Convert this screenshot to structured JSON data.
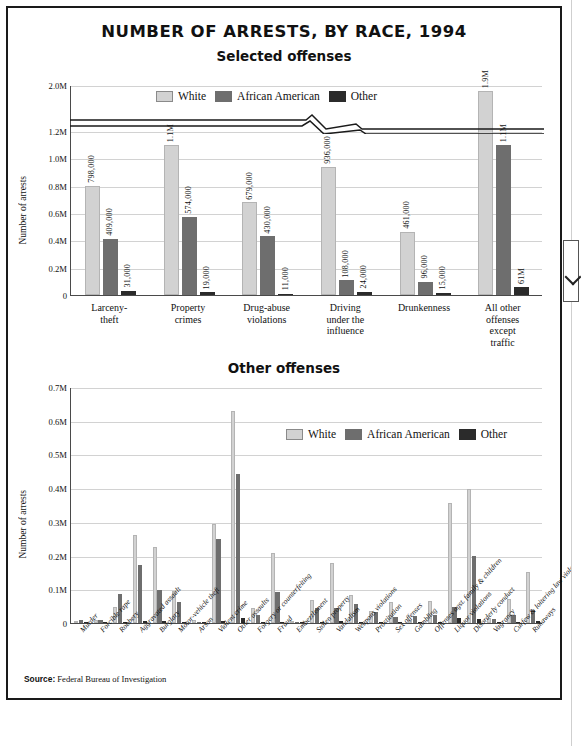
{
  "title": "NUMBER OF ARRESTS, BY RACE, 1994",
  "source_label": "Source:",
  "source_text": "Federal Bureau of Investigation",
  "colors": {
    "white": "#d2d2d2",
    "african_american": "#6e6e6e",
    "other": "#2b2b2b"
  },
  "legend": {
    "white": "White",
    "african_american": "African American",
    "other": "Other"
  },
  "chart_data": [
    {
      "type": "bar",
      "title": "Selected offenses",
      "xlabel": "",
      "ylabel": "Number of arrests",
      "ylim": [
        0,
        2000000
      ],
      "axis_break": true,
      "axis_break_between": [
        1200000,
        2000000
      ],
      "grid": true,
      "legend_position": "top-center",
      "ytick_labels": [
        "0",
        "0.2M",
        "0.4M",
        "0.6M",
        "0.8M",
        "1.0M",
        "1.2M",
        "2.0M"
      ],
      "ytick_values": [
        0,
        200000,
        400000,
        600000,
        800000,
        1000000,
        1200000,
        2000000
      ],
      "categories": [
        "Larceny-\ntheft",
        "Property\ncrimes",
        "Drug-abuse\nviolations",
        "Driving\nunder the\ninfluence",
        "Drunkenness",
        "All other\noffenses\nexcept\ntraffic"
      ],
      "series": [
        {
          "name": "White",
          "values": [
            798000,
            1100000,
            679000,
            936000,
            461000,
            1900000
          ],
          "labels": [
            "798,000",
            "1.1M",
            "679,000",
            "936,000",
            "461,000",
            "1.9M"
          ]
        },
        {
          "name": "African American",
          "values": [
            409000,
            574000,
            430000,
            108000,
            96000,
            1100000
          ],
          "labels": [
            "409,000",
            "574,000",
            "430,000",
            "108,000",
            "96,000",
            "1.1M"
          ]
        },
        {
          "name": "Other",
          "values": [
            31000,
            19000,
            11000,
            24000,
            15000,
            61000
          ],
          "labels": [
            "31,000",
            "19,000",
            "11,000",
            "24,000",
            "15,000",
            "61M"
          ]
        }
      ]
    },
    {
      "type": "bar",
      "title": "Other offenses",
      "xlabel": "",
      "ylabel": "Number of arrests",
      "ylim": [
        0,
        700000
      ],
      "grid": true,
      "legend_position": "upper-right",
      "ytick_labels": [
        "0",
        "0.1M",
        "0.2M",
        "0.3M",
        "0.4M",
        "0.5M",
        "0.6M",
        "0.7M"
      ],
      "ytick_values": [
        0,
        100000,
        200000,
        300000,
        400000,
        500000,
        600000,
        700000
      ],
      "categories": [
        "Murder",
        "Forcible rape",
        "Robbery",
        "Aggravated assault",
        "Burglary",
        "Motor-vehicle theft",
        "Arson",
        "Violent crime",
        "Other assaults",
        "Forgery or counterfeiting",
        "Fraud",
        "Embezzlement",
        "Stolen property",
        "Vandalism",
        "Weapons violations",
        "Prostitution",
        "Sex offenses",
        "Gambling",
        "Offenses agst. family & children",
        "Liquor violations",
        "Disorderly conduct",
        "Vagrancy",
        "Curfew & loitering law violations",
        "Runaways"
      ],
      "series": [
        {
          "name": "White",
          "values": [
            6000,
            10000,
            48000,
            260000,
            224000,
            95000,
            10000,
            294000,
            628000,
            46000,
            208000,
            7000,
            68000,
            179000,
            84000,
            37000,
            62000,
            10000,
            64000,
            355000,
            397000,
            15000,
            70000,
            151000
          ]
        },
        {
          "name": "African American",
          "values": [
            9000,
            9000,
            85000,
            172000,
            98000,
            63000,
            3000,
            248000,
            441000,
            25000,
            93000,
            3000,
            44000,
            46000,
            56000,
            32000,
            19000,
            22000,
            25000,
            48000,
            199000,
            12000,
            23000,
            40000
          ]
        },
        {
          "name": "Other",
          "values": [
            1000,
            1000,
            2000,
            5000,
            5000,
            4000,
            1000,
            5000,
            14000,
            1000,
            4000,
            1000,
            2000,
            6000,
            3000,
            3000,
            2000,
            1000,
            3000,
            16000,
            11000,
            1000,
            4000,
            6000
          ]
        }
      ]
    }
  ]
}
